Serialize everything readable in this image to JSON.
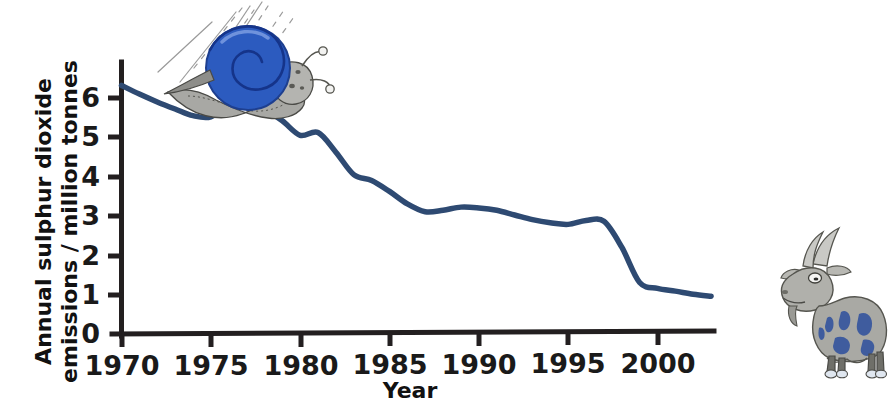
{
  "figure": {
    "background_color": "#ffffff",
    "axis_color": "#231f20",
    "line_color": "#2e4a72"
  },
  "axes": {
    "y_title_line1": "Annual sulphur dioxide",
    "y_title_line2": "emissions / million tonnes",
    "x_title": "Year",
    "y_ticks": [
      "6",
      "5",
      "4",
      "3",
      "2",
      "1",
      "0"
    ],
    "x_ticks": [
      "1970",
      "1975",
      "1980",
      "1985",
      "1990",
      "1995",
      "2000"
    ]
  },
  "illustrations": [
    {
      "name": "snail",
      "description": "cartoon snail with blue spiral shell sliding down the line with speed lines"
    },
    {
      "name": "goat",
      "description": "cartoon grey and blue goat standing at right of chart"
    }
  ],
  "chart_data": {
    "type": "line",
    "title": "",
    "xlabel": "Year",
    "ylabel": "Annual sulphur dioxide emissions / million tonnes",
    "xlim": [
      1970,
      2003
    ],
    "ylim": [
      0,
      6.6
    ],
    "grid": false,
    "legend": null,
    "series": [
      {
        "name": "Annual sulphur dioxide emissions",
        "color": "#2e4a72",
        "x": [
          1970,
          1971,
          1972,
          1973,
          1974,
          1975,
          1976,
          1977,
          1978,
          1979,
          1980,
          1981,
          1982,
          1983,
          1984,
          1985,
          1986,
          1987,
          1988,
          1989,
          1990,
          1991,
          1992,
          1993,
          1994,
          1995,
          1996,
          1997,
          1998,
          1999,
          2000,
          2001,
          2002,
          2003
        ],
        "y": [
          6.32,
          6.1,
          5.9,
          5.72,
          5.55,
          5.52,
          5.85,
          5.92,
          5.72,
          5.42,
          5.05,
          5.12,
          4.62,
          4.05,
          3.9,
          3.62,
          3.3,
          3.1,
          3.14,
          3.22,
          3.2,
          3.14,
          3.02,
          2.9,
          2.82,
          2.78,
          2.88,
          2.86,
          2.2,
          1.3,
          1.15,
          1.08,
          1.0,
          0.95
        ]
      }
    ]
  }
}
